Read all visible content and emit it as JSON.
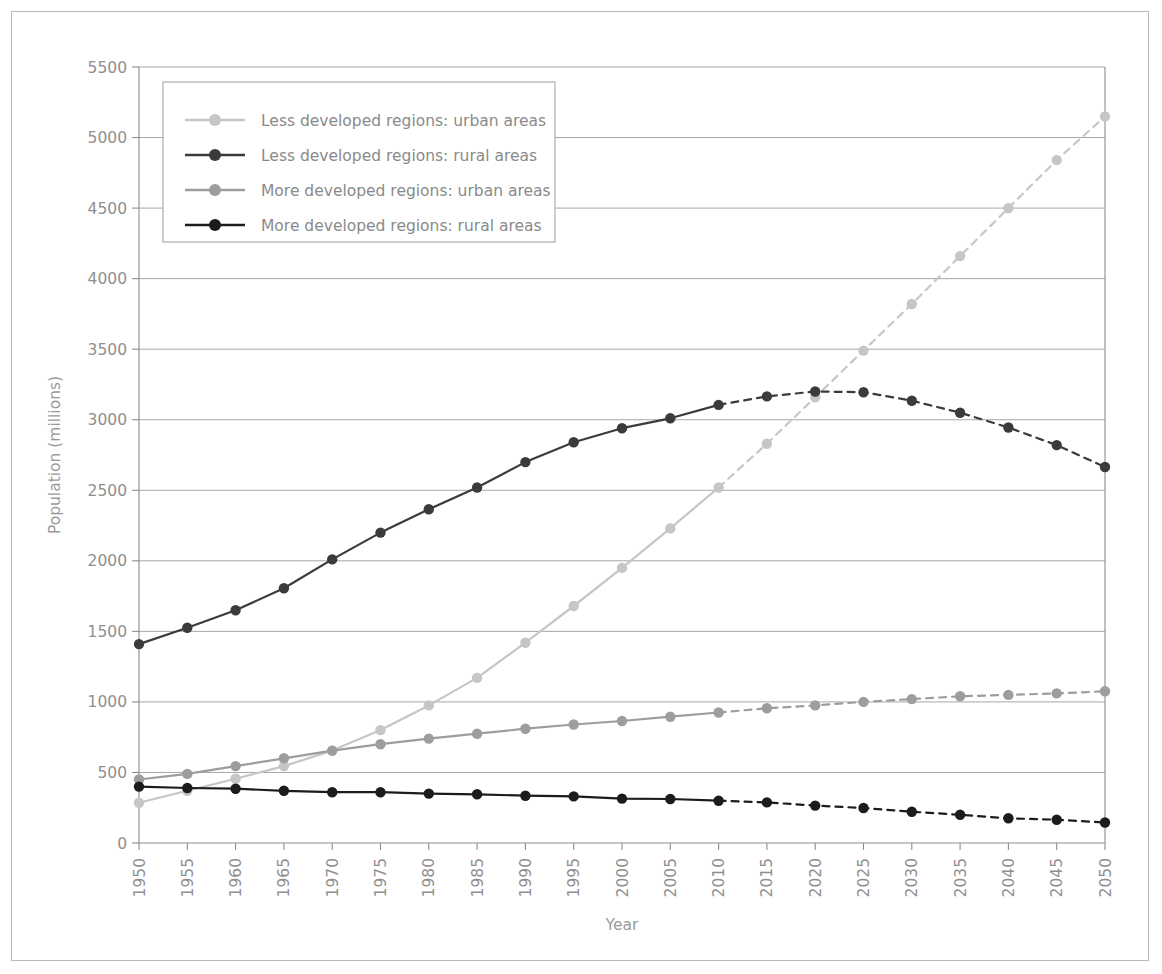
{
  "chart_data": {
    "type": "line",
    "title": "",
    "xlabel": "Year",
    "ylabel": "Population (millions)",
    "xlim": [
      1950,
      2050
    ],
    "ylim": [
      0,
      5500
    ],
    "yticks": [
      0,
      500,
      1000,
      1500,
      2000,
      2500,
      3000,
      3500,
      4000,
      4500,
      5000,
      5500
    ],
    "grid": "horizontal",
    "legend_position": "top-left",
    "projection_starts": 2010,
    "projection_style": "dashed",
    "x": [
      1950,
      1955,
      1960,
      1965,
      1970,
      1975,
      1980,
      1985,
      1990,
      1995,
      2000,
      2005,
      2010,
      2015,
      2020,
      2025,
      2030,
      2035,
      2040,
      2045,
      2050
    ],
    "categories": [
      "1950",
      "1955",
      "1960",
      "1965",
      "1970",
      "1975",
      "1980",
      "1985",
      "1990",
      "1995",
      "2000",
      "2005",
      "2010",
      "2015",
      "2020",
      "2025",
      "2030",
      "2035",
      "2040",
      "2045",
      "2050"
    ],
    "series": [
      {
        "name": "Less developed regions: urban areas",
        "color": "#c6c6c6",
        "values": [
          285,
          370,
          455,
          545,
          655,
          800,
          975,
          1170,
          1420,
          1680,
          1950,
          2230,
          2520,
          2830,
          3160,
          3490,
          3820,
          4160,
          4500,
          4840,
          5150
        ]
      },
      {
        "name": "Less developed regions: rural areas",
        "color": "#3b3b3b",
        "values": [
          1410,
          1525,
          1650,
          1805,
          2010,
          2200,
          2365,
          2520,
          2700,
          2840,
          2940,
          3010,
          3105,
          3165,
          3200,
          3195,
          3135,
          3050,
          2945,
          2820,
          2665
        ]
      },
      {
        "name": "More developed regions: urban areas",
        "color": "#9d9d9d",
        "values": [
          450,
          490,
          545,
          600,
          655,
          700,
          740,
          775,
          810,
          840,
          865,
          895,
          925,
          955,
          975,
          1000,
          1020,
          1040,
          1050,
          1060,
          1075
        ]
      },
      {
        "name": "More developed regions: rural areas",
        "color": "#1c1c1c",
        "values": [
          400,
          390,
          385,
          370,
          360,
          360,
          350,
          345,
          335,
          330,
          315,
          312,
          300,
          288,
          265,
          248,
          222,
          200,
          175,
          165,
          145
        ]
      }
    ]
  },
  "legend": {
    "entries": [
      "Less developed regions: urban areas",
      "Less developed regions: rural areas",
      "More developed regions: urban areas",
      "More developed regions: rural areas"
    ]
  },
  "axes": {
    "x_title": "Year",
    "y_title": "Population (millions)"
  }
}
